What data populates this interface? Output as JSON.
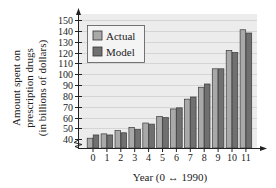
{
  "chart_data": {
    "type": "bar",
    "title": "",
    "xlabel": "Year (0 ↔ 1990)",
    "ylabel_lines": [
      "Amount spent on",
      "prescription drugs",
      "(in billions of dollars)"
    ],
    "ylabel": "Amount spent on prescription drugs (in billions of dollars)",
    "categories": [
      "0",
      "1",
      "2",
      "3",
      "4",
      "5",
      "6",
      "7",
      "8",
      "9",
      "10",
      "11"
    ],
    "yticks": [
      40,
      50,
      60,
      70,
      80,
      90,
      100,
      110,
      120,
      130,
      140,
      150
    ],
    "ylim": [
      40,
      150
    ],
    "y_axis_break": true,
    "grid": true,
    "legend_position": "top-left",
    "series": [
      {
        "name": "Actual",
        "color": "#a9a9a9",
        "values": [
          41,
          45,
          48,
          51,
          55,
          61,
          68,
          77,
          88,
          105,
          122,
          141
        ]
      },
      {
        "name": "Model",
        "color": "#707070",
        "values": [
          44,
          44,
          46,
          49,
          54,
          60,
          69,
          79,
          91,
          105,
          120,
          138
        ]
      }
    ]
  }
}
